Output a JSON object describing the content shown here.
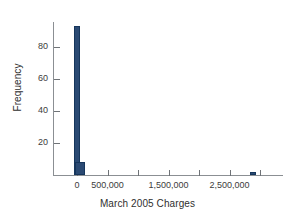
{
  "chart_data": {
    "type": "bar",
    "title": "",
    "subtitle": "",
    "xlabel": "March 2005 Charges",
    "ylabel": "Frequency",
    "grid": false,
    "legend": null,
    "xlim": [
      -250000,
      3250000
    ],
    "ylim": [
      0,
      100
    ],
    "x_ticks": [
      {
        "value": 0,
        "label": "0"
      },
      {
        "value": 500000,
        "label": "500,000"
      },
      {
        "value": 1000000,
        "label": ""
      },
      {
        "value": 1500000,
        "label": "1,500,000"
      },
      {
        "value": 2000000,
        "label": ""
      },
      {
        "value": 2500000,
        "label": "2,500,000"
      },
      {
        "value": 3000000,
        "label": ""
      }
    ],
    "y_ticks": [
      {
        "value": 20,
        "label": "20"
      },
      {
        "value": 40,
        "label": "40"
      },
      {
        "value": 60,
        "label": "60"
      },
      {
        "value": 80,
        "label": "80"
      }
    ],
    "bars": [
      {
        "name": "bin-0",
        "x_center": 0,
        "width_value": 100000,
        "value": 93
      },
      {
        "name": "bin-1",
        "x_center": 50000,
        "width_value": 160000,
        "value": 8
      },
      {
        "name": "bin-outlier",
        "x_center": 2890000,
        "width_value": 100000,
        "value": 2
      }
    ],
    "bar_color": "#2b4a73",
    "bar_edge_color": "#16365c",
    "axis_color": "#8b8f93"
  }
}
